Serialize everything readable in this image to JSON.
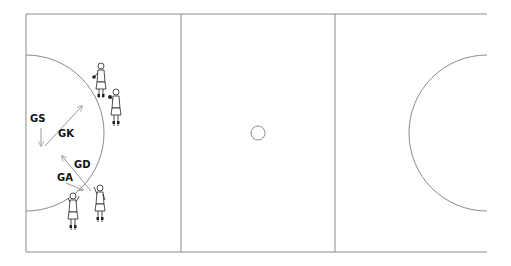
{
  "diagram": {
    "court": {
      "left": 26,
      "top": 14,
      "right": 487,
      "bottom": 252,
      "third_lines_x": [
        181,
        335
      ],
      "centre_circle": {
        "cx": 258,
        "cy": 133,
        "r": 7
      },
      "goal_circle_left": {
        "cx": 26,
        "cy": 133,
        "r": 78
      },
      "goal_circle_right": {
        "cx": 487,
        "cy": 133,
        "r": 78
      },
      "line_color": "#8a8a8a"
    },
    "labels": [
      {
        "id": "gs",
        "text": "GS",
        "x": 30,
        "y": 122
      },
      {
        "id": "gk",
        "text": "GK",
        "x": 58,
        "y": 137
      },
      {
        "id": "gd",
        "text": "GD",
        "x": 74,
        "y": 168
      },
      {
        "id": "ga",
        "text": "GA",
        "x": 57,
        "y": 181
      }
    ],
    "arrows": [
      {
        "id": "gs-arrow",
        "from": [
          41,
          128
        ],
        "to": [
          41,
          146
        ]
      },
      {
        "id": "gk-arrow",
        "from": [
          45,
          146
        ],
        "to": [
          82,
          106
        ]
      },
      {
        "id": "gd-arrow",
        "from": [
          91,
          191
        ],
        "to": [
          62,
          156
        ]
      },
      {
        "id": "ga-arrow",
        "from": [
          66,
          183
        ],
        "to": [
          83,
          190
        ]
      }
    ],
    "players": [
      {
        "id": "player-top-1",
        "x": 101,
        "y": 70,
        "pose": "holding-ball"
      },
      {
        "id": "player-top-2",
        "x": 116,
        "y": 96,
        "pose": "holding-ball"
      },
      {
        "id": "player-bottom-1",
        "x": 73,
        "y": 195,
        "pose": "arm-raised"
      },
      {
        "id": "player-bottom-2",
        "x": 100,
        "y": 185,
        "pose": "arm-raised"
      }
    ]
  }
}
